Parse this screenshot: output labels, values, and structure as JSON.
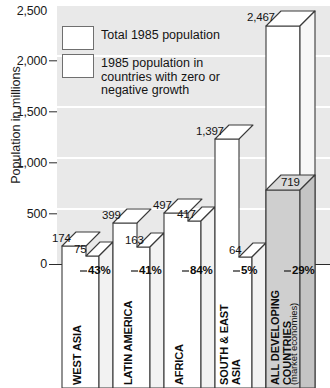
{
  "title_sliver": "",
  "axis": {
    "ylabel": "Population in millions",
    "yticks": [
      "2,500",
      "2,000",
      "1,500",
      "1,000",
      "500",
      "0"
    ]
  },
  "legend": {
    "items": [
      {
        "label": "Total 1985 population",
        "swatch": "#ffffff"
      },
      {
        "label": "1985 population in countries with zero or negative growth",
        "swatch": "#ffffff"
      }
    ]
  },
  "colors": {
    "plot_background": "#e9e9e9",
    "gridline": "#ffffff",
    "bar_fill": "#ffffff",
    "bar_shade": "#cfcfcf",
    "bar_outline": "#3a3a3a",
    "axis": "#2b2b2b",
    "text": "#141414"
  },
  "chart_data": {
    "type": "bar",
    "title": "",
    "xlabel": "",
    "ylabel": "Population in millions",
    "ylim": [
      0,
      2500
    ],
    "yticks": [
      0,
      500,
      1000,
      1500,
      2000,
      2500
    ],
    "grid": true,
    "legend_position": "top-left",
    "categories": [
      "WEST ASIA",
      "LATIN AMERICA",
      "AFRICA",
      "SOUTH & EAST ASIA",
      "ALL DEVELOPING COUNTRIES"
    ],
    "category_sublabels": [
      "",
      "",
      "",
      "",
      "(market economies)"
    ],
    "series": [
      {
        "name": "Total 1985 population",
        "values": [
          174,
          399,
          497,
          1397,
          2467
        ],
        "value_labels": [
          "174",
          "399",
          "497",
          "1,397",
          "2,467"
        ]
      },
      {
        "name": "1985 population in countries with zero or negative growth",
        "values": [
          75,
          163,
          417,
          64,
          719
        ],
        "value_labels": [
          "75",
          "163",
          "417",
          "64",
          "719"
        ]
      }
    ],
    "share_labels": [
      "43%",
      "41%",
      "84%",
      "5%",
      "29%"
    ],
    "shares": [
      43,
      41,
      84,
      5,
      29
    ]
  }
}
